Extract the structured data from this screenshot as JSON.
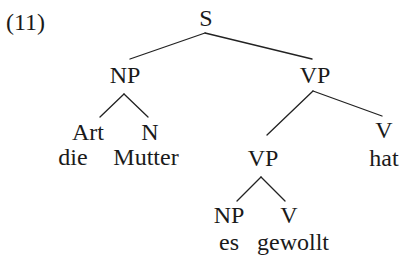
{
  "example_number": "(11)",
  "tree": {
    "root": "S",
    "subject_np": {
      "label": "NP",
      "art": {
        "label": "Art",
        "word": "die"
      },
      "noun": {
        "label": "N",
        "word": "Mutter"
      }
    },
    "vp": {
      "label": "VP",
      "inner_vp": {
        "label": "VP",
        "np": {
          "label": "NP",
          "word": "es"
        },
        "verb": {
          "label": "V",
          "word": "gewollt"
        }
      },
      "verb": {
        "label": "V",
        "word": "hat"
      }
    }
  },
  "colors": {
    "text": "#1a1a1a",
    "edges": "#222222",
    "background": "#ffffff"
  }
}
